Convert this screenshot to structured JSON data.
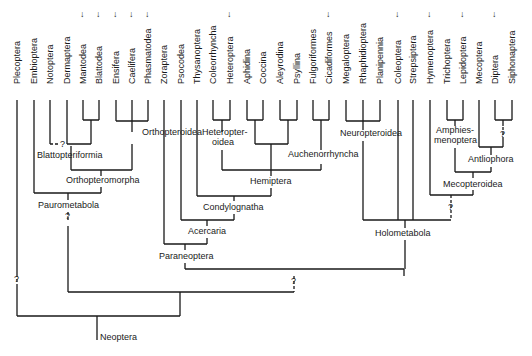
{
  "diagram": {
    "root_label": "Neoptera",
    "taxa": [
      {
        "name": "Plecoptera",
        "x": 17,
        "dagger": false
      },
      {
        "name": "Embioptera",
        "x": 34,
        "dagger": false
      },
      {
        "name": "Notoptera",
        "x": 50,
        "dagger": false
      },
      {
        "name": "Dermaptera",
        "x": 67,
        "dagger": false
      },
      {
        "name": "Mantodea",
        "x": 83,
        "dagger": true
      },
      {
        "name": "Blattodea",
        "x": 99,
        "dagger": true
      },
      {
        "name": "Ensifera",
        "x": 116,
        "dagger": true
      },
      {
        "name": "Caelifera",
        "x": 132,
        "dagger": true
      },
      {
        "name": "Phasmatodea",
        "x": 148,
        "dagger": true
      },
      {
        "name": "Zoraptera",
        "x": 164,
        "dagger": false
      },
      {
        "name": "Psocodea",
        "x": 181,
        "dagger": false
      },
      {
        "name": "Thysanoptera",
        "x": 197,
        "dagger": false
      },
      {
        "name": "Coleorrhyncha",
        "x": 213,
        "dagger": false
      },
      {
        "name": "Heteroptera",
        "x": 230,
        "dagger": true
      },
      {
        "name": "Aphidina",
        "x": 247,
        "dagger": false
      },
      {
        "name": "Coccina",
        "x": 263,
        "dagger": false
      },
      {
        "name": "Aleyrodina",
        "x": 280,
        "dagger": false
      },
      {
        "name": "Psyllina",
        "x": 297,
        "dagger": false
      },
      {
        "name": "Fulgoriformes",
        "x": 313,
        "dagger": false
      },
      {
        "name": "Cicadiformes",
        "x": 329,
        "dagger": true
      },
      {
        "name": "Megaloptera",
        "x": 346,
        "dagger": false
      },
      {
        "name": "Rhaphidioptera",
        "x": 363,
        "dagger": false
      },
      {
        "name": "Planipennia",
        "x": 380,
        "dagger": false
      },
      {
        "name": "Coleoptera",
        "x": 398,
        "dagger": true
      },
      {
        "name": "Strepsiptera",
        "x": 413,
        "dagger": false
      },
      {
        "name": "Hymenoptera",
        "x": 430,
        "dagger": true
      },
      {
        "name": "Trichoptera",
        "x": 447,
        "dagger": false
      },
      {
        "name": "Lepidoptera",
        "x": 463,
        "dagger": true
      },
      {
        "name": "Mecoptera",
        "x": 479,
        "dagger": false
      },
      {
        "name": "Diptera",
        "x": 495,
        "dagger": true
      },
      {
        "name": "Siphonaptera",
        "x": 512,
        "dagger": false
      }
    ],
    "clades": [
      {
        "name": "Orthopteroidea",
        "x": 142,
        "y": 135
      },
      {
        "name": "Blattopteriformia",
        "x": 37,
        "y": 158
      },
      {
        "name": "Orthopteromorpha",
        "x": 66,
        "y": 183
      },
      {
        "name": "Paurometabola",
        "x": 38,
        "y": 208
      },
      {
        "name": "Heteropter-",
        "x": 202,
        "y": 135
      },
      {
        "name": "oidea",
        "x": 212,
        "y": 145
      },
      {
        "name": "Auchenorrhyncha",
        "x": 288,
        "y": 157
      },
      {
        "name": "Hemiptera",
        "x": 250,
        "y": 184
      },
      {
        "name": "Condylognatha",
        "x": 203,
        "y": 210
      },
      {
        "name": "Acercaria",
        "x": 188,
        "y": 234
      },
      {
        "name": "Paraneoptera",
        "x": 159,
        "y": 259
      },
      {
        "name": "Neuropteroidea",
        "x": 340,
        "y": 136
      },
      {
        "name": "Amphies-",
        "x": 436,
        "y": 133
      },
      {
        "name": "menoptera",
        "x": 434,
        "y": 143
      },
      {
        "name": "Antliophora",
        "x": 468,
        "y": 162
      },
      {
        "name": "Mecopteroidea",
        "x": 443,
        "y": 187
      },
      {
        "name": "Holometabola",
        "x": 375,
        "y": 236
      },
      {
        "name": "Neoptera",
        "x": 100,
        "y": 340
      }
    ],
    "uncertain_marker": "?",
    "extinct_marker": "↓",
    "colors": {
      "line": "#1a1a1a",
      "text": "#1a1a1a",
      "background": "#ffffff"
    }
  }
}
